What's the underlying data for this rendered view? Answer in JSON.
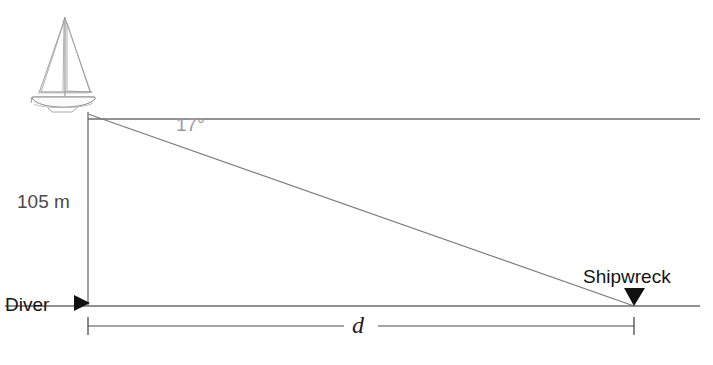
{
  "figure": {
    "kind": "trigonometry-word-problem-diagram",
    "background_color": "#ffffff"
  },
  "labels": {
    "depth": "105 m",
    "angle": "17°",
    "diver": "Diver",
    "shipwreck": "Shipwreck",
    "distance": "d"
  },
  "colors": {
    "line_dark": "#4a4a4a",
    "line_mid": "#6e6e6e",
    "line_light": "#8e8e8e",
    "text_dark": "#141414",
    "text_grey": "#4a4a4a",
    "angle_grey": "#9a9a9a",
    "marker_black": "#111111",
    "sketch": "#8a8a8a",
    "sketch_light": "#b4b4b4"
  },
  "geometry": {
    "surface_line": {
      "x1": 88,
      "y1": 119,
      "x2": 700,
      "y2": 119
    },
    "seafloor_line": {
      "x1": 5,
      "y1": 306,
      "x2": 700,
      "y2": 306
    },
    "depth_line": {
      "x1": 88,
      "y1": 112,
      "x2": 88,
      "y2": 306
    },
    "sight_line": {
      "x1": 88,
      "y1": 114,
      "x2": 634,
      "y2": 306
    },
    "dimension_line": {
      "y": 326,
      "x_start": 88,
      "x_end": 634,
      "tick_half_height": 9
    },
    "diver_marker": {
      "x": 88,
      "y": 303,
      "shape": "triangle-right"
    },
    "shipwreck_marker": {
      "x": 634,
      "y": 305,
      "shape": "triangle-down"
    },
    "boat": {
      "x": 30,
      "y": 15,
      "width": 66,
      "height": 97
    }
  },
  "values": {
    "depth_meters": 105,
    "angle_of_depression_degrees": 17,
    "horizontal_distance_symbol": "d"
  }
}
